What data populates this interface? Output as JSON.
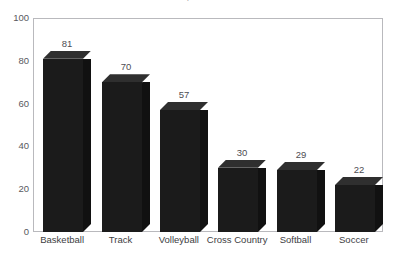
{
  "chart_data": {
    "type": "bar",
    "title": "Girls' Sports at BHS",
    "categories": [
      "Basketball",
      "Track",
      "Volleyball",
      "Cross Country",
      "Softball",
      "Soccer"
    ],
    "values": [
      81,
      70,
      57,
      30,
      29,
      22
    ],
    "value_labels": [
      "81",
      "70",
      "57",
      "30",
      "29",
      "22"
    ],
    "xlabel": "",
    "ylabel": "",
    "ylim": [
      0,
      100
    ],
    "yticks": [
      0,
      20,
      40,
      60,
      80,
      100
    ],
    "ytick_labels": [
      "0",
      "20",
      "40",
      "60",
      "80",
      "100"
    ],
    "grid": false,
    "legend": false,
    "style": {
      "bar_front_color": "#1b1b1b",
      "bar_top_color": "#2f2f2f",
      "bar_side_color": "#111111",
      "frame_color": "#b9b9bd",
      "background_color": "#ffffff",
      "tick_label_color": "#59595e",
      "value_label_color": "#4d4d52"
    }
  }
}
